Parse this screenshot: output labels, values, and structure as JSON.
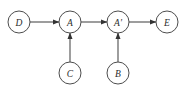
{
  "diagram": {
    "background_color": "#ffffff",
    "node_fill_color": "#ffffff",
    "node_stroke_color": "#4d4d4d",
    "edge_color": "#4d4d4d",
    "label_color": "#2b2b2b",
    "nodes": [
      {
        "id": "D",
        "label": "D",
        "cx": 19,
        "cy": 22,
        "r": 11
      },
      {
        "id": "A",
        "label": "A",
        "cx": 70,
        "cy": 22,
        "r": 11
      },
      {
        "id": "Ap",
        "label": "A'",
        "cx": 118,
        "cy": 22,
        "r": 11
      },
      {
        "id": "E",
        "label": "E",
        "cx": 167,
        "cy": 22,
        "r": 11
      },
      {
        "id": "C",
        "label": "C",
        "cx": 70,
        "cy": 73,
        "r": 11
      },
      {
        "id": "B",
        "label": "B",
        "cx": 118,
        "cy": 73,
        "r": 11
      }
    ],
    "edges": [
      {
        "id": "D-A",
        "from": "D",
        "to": "A",
        "direction": "right",
        "x1": 30,
        "y1": 22,
        "x2": 59,
        "y2": 22
      },
      {
        "id": "A-Ap",
        "from": "A",
        "to": "Ap",
        "direction": "right",
        "x1": 81,
        "y1": 22,
        "x2": 107,
        "y2": 22
      },
      {
        "id": "Ap-E",
        "from": "Ap",
        "to": "E",
        "direction": "right",
        "x1": 129,
        "y1": 22,
        "x2": 156,
        "y2": 22
      },
      {
        "id": "C-A",
        "from": "C",
        "to": "A",
        "direction": "up",
        "x1": 70,
        "y1": 62,
        "x2": 70,
        "y2": 33
      },
      {
        "id": "B-Ap",
        "from": "B",
        "to": "Ap",
        "direction": "up",
        "x1": 118,
        "y1": 62,
        "x2": 118,
        "y2": 33
      }
    ]
  }
}
